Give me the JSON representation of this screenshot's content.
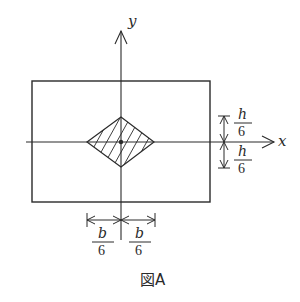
{
  "figure": {
    "caption": "図A",
    "axes": {
      "x_label": "x",
      "y_label": "y"
    },
    "dimensions": {
      "h_upper": {
        "numerator": "h",
        "denominator": "6"
      },
      "h_lower": {
        "numerator": "h",
        "denominator": "6"
      },
      "b_left": {
        "numerator": "b",
        "denominator": "6"
      },
      "b_right": {
        "numerator": "b",
        "denominator": "6"
      }
    },
    "shapes": {
      "section": "rectangle",
      "core": "hatched-rhombus",
      "centroid": "dot"
    },
    "colors": {
      "stroke": "#2a2a2a",
      "background": "#ffffff"
    }
  }
}
